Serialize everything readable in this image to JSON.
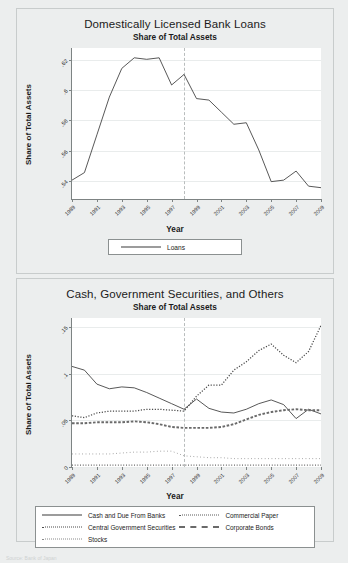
{
  "page": {
    "background": "#eceeee",
    "source_note": "Source: Bank of Japan"
  },
  "figures": [
    {
      "id": "top",
      "title": "Domestically Licensed Bank Loans",
      "subtitle": "Share of Total Assets",
      "xlabel": "Year",
      "ylabel": "Share of Total Assets"
    },
    {
      "id": "bottom",
      "title": "Cash, Government Securities, and Others",
      "subtitle": "Share of Total Assets",
      "xlabel": "Year",
      "ylabel": "Share of Total Assets"
    }
  ],
  "chart_data": [
    {
      "type": "line",
      "id": "loans-chart",
      "title": "Domestically Licensed Bank Loans",
      "subtitle": "Share of Total Assets",
      "xlabel": "Year",
      "ylabel": "Share of Total Assets",
      "xlim": [
        1989,
        2009
      ],
      "ylim": [
        0.528,
        0.628
      ],
      "yticks": [
        0.54,
        0.56,
        0.58,
        0.6,
        0.62
      ],
      "ytick_labels": [
        ".54",
        ".56",
        ".58",
        ".6",
        ".62"
      ],
      "xticks": [
        1989,
        1991,
        1993,
        1995,
        1997,
        1999,
        2001,
        2003,
        2005,
        2007,
        2009
      ],
      "xtick_labels": [
        "1989",
        "1991",
        "1993",
        "1995",
        "1997",
        "1999",
        "2001",
        "2003",
        "2005",
        "2007",
        "2009"
      ],
      "grid": true,
      "annotations": [
        {
          "type": "vline",
          "x": 1998,
          "style": "dashed"
        }
      ],
      "legend_position": "below",
      "series": [
        {
          "name": "Loans",
          "style": "solid",
          "x": [
            1989,
            1990,
            1991,
            1992,
            1993,
            1994,
            1995,
            1996,
            1997,
            1998,
            1999,
            2000,
            2001,
            2002,
            2003,
            2004,
            2005,
            2006,
            2007,
            2008,
            2009
          ],
          "values": [
            0.5405,
            0.5455,
            0.5705,
            0.5955,
            0.6145,
            0.6215,
            0.6205,
            0.6215,
            0.6035,
            0.6105,
            0.5945,
            0.5935,
            0.5855,
            0.5775,
            0.5785,
            0.5605,
            0.5395,
            0.5405,
            0.5465,
            0.5365,
            0.5355
          ]
        }
      ]
    },
    {
      "type": "line",
      "id": "cash-gov-others-chart",
      "title": "Cash, Government Securities, and Others",
      "subtitle": "Share of Total Assets",
      "xlabel": "Year",
      "ylabel": "Share of Total Assets",
      "xlim": [
        1989,
        2009
      ],
      "ylim": [
        0,
        0.16
      ],
      "yticks": [
        0,
        0.05,
        0.1,
        0.15
      ],
      "ytick_labels": [
        "0",
        ".05",
        ".1",
        ".15"
      ],
      "xticks": [
        1989,
        1991,
        1993,
        1995,
        1997,
        1999,
        2001,
        2003,
        2005,
        2007,
        2009
      ],
      "xtick_labels": [
        "1989",
        "1991",
        "1993",
        "1995",
        "1997",
        "1999",
        "2001",
        "2003",
        "2005",
        "2007",
        "2009"
      ],
      "grid": true,
      "annotations": [
        {
          "type": "vline",
          "x": 1998,
          "style": "dashed"
        }
      ],
      "legend_position": "below",
      "series": [
        {
          "name": "Cash and Due From Banks",
          "style": "solid",
          "x": [
            1989,
            1990,
            1991,
            1992,
            1993,
            1994,
            1995,
            1996,
            1997,
            1998,
            1999,
            2000,
            2001,
            2002,
            2003,
            2004,
            2005,
            2006,
            2007,
            2008,
            2009
          ],
          "values": [
            0.108,
            0.104,
            0.089,
            0.084,
            0.086,
            0.085,
            0.08,
            0.074,
            0.068,
            0.062,
            0.073,
            0.063,
            0.059,
            0.058,
            0.062,
            0.068,
            0.072,
            0.067,
            0.052,
            0.062,
            0.057
          ]
        },
        {
          "name": "Commercial Paper",
          "style": "fine-dotted",
          "x": [
            1989,
            1990,
            1991,
            1992,
            1993,
            1994,
            1995,
            1996,
            1997,
            1998,
            1999,
            2000,
            2001,
            2002,
            2003,
            2004,
            2005,
            2006,
            2007,
            2008,
            2009
          ],
          "values": [
            0.002,
            0.002,
            0.002,
            0.002,
            0.002,
            0.002,
            0.002,
            0.002,
            0.002,
            0.002,
            0.002,
            0.002,
            0.002,
            0.002,
            0.002,
            0.002,
            0.002,
            0.002,
            0.002,
            0.002,
            0.002
          ]
        },
        {
          "name": "Central Government Securities",
          "style": "dotted",
          "x": [
            1989,
            1990,
            1991,
            1992,
            1993,
            1994,
            1995,
            1996,
            1997,
            1998,
            1999,
            2000,
            2001,
            2002,
            2003,
            2004,
            2005,
            2006,
            2007,
            2008,
            2009
          ],
          "values": [
            0.055,
            0.053,
            0.058,
            0.06,
            0.06,
            0.06,
            0.062,
            0.062,
            0.061,
            0.06,
            0.076,
            0.088,
            0.088,
            0.104,
            0.113,
            0.125,
            0.132,
            0.12,
            0.112,
            0.124,
            0.152
          ]
        },
        {
          "name": "Corporate Bonds",
          "style": "dashed",
          "x": [
            1989,
            1990,
            1991,
            1992,
            1993,
            1994,
            1995,
            1996,
            1997,
            1998,
            1999,
            2000,
            2001,
            2002,
            2003,
            2004,
            2005,
            2006,
            2007,
            2008,
            2009
          ],
          "values": [
            0.047,
            0.047,
            0.048,
            0.048,
            0.048,
            0.049,
            0.048,
            0.046,
            0.043,
            0.042,
            0.042,
            0.042,
            0.043,
            0.046,
            0.051,
            0.056,
            0.059,
            0.061,
            0.062,
            0.061,
            0.061
          ]
        },
        {
          "name": "Stocks",
          "style": "sparse-dotted",
          "x": [
            1989,
            1990,
            1991,
            1992,
            1993,
            1994,
            1995,
            1996,
            1997,
            1998,
            1999,
            2000,
            2001,
            2002,
            2003,
            2004,
            2005,
            2006,
            2007,
            2008,
            2009
          ],
          "values": [
            0.014,
            0.014,
            0.014,
            0.014,
            0.015,
            0.016,
            0.016,
            0.017,
            0.017,
            0.012,
            0.011,
            0.01,
            0.01,
            0.009,
            0.009,
            0.009,
            0.009,
            0.009,
            0.009,
            0.009,
            0.009
          ]
        }
      ]
    }
  ],
  "legends": {
    "top": [
      {
        "label": "Loans",
        "style": "solid"
      }
    ],
    "bottom": [
      {
        "label": "Cash and Due From Banks",
        "style": "solid"
      },
      {
        "label": "Commercial Paper",
        "style": "fine-dotted"
      },
      {
        "label": "Central Government Securities",
        "style": "dotted"
      },
      {
        "label": "Corporate Bonds",
        "style": "dashed"
      },
      {
        "label": "Stocks",
        "style": "sparse-dotted"
      }
    ]
  }
}
